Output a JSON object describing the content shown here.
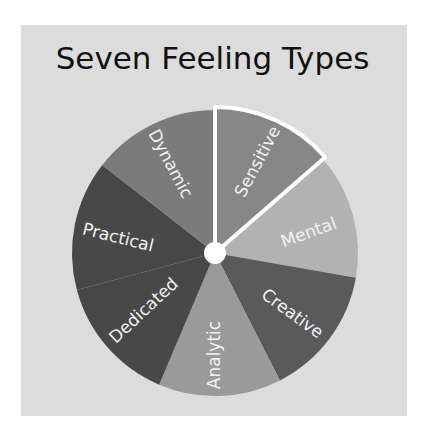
{
  "chart_data": {
    "type": "pie",
    "title": "Seven Feeling Types",
    "categories": [
      "Sensitive",
      "Mental",
      "Creative",
      "Analytic",
      "Dedicated",
      "Practical",
      "Dynamic"
    ],
    "values": [
      49,
      51,
      53,
      50,
      52,
      53,
      52
    ],
    "start_angle_deg": 0,
    "direction": "clockwise",
    "highlighted": "Sensitive",
    "colors": {
      "Sensitive": "#878787",
      "Mental": "#b2b2b2",
      "Creative": "#5a5a5a",
      "Analytic": "#9a9a9a",
      "Dedicated": "#484848",
      "Practical": "#484848",
      "Dynamic": "#7b7b7b"
    },
    "legend": "none (labels inside wedges)"
  },
  "title": "Seven Feeling Types",
  "labels": {
    "sensitive": "Sensitive",
    "mental": "Mental",
    "creative": "Creative",
    "analytic": "Analytic",
    "dedicated": "Dedicated",
    "practical": "Practical",
    "dynamic": "Dynamic"
  }
}
